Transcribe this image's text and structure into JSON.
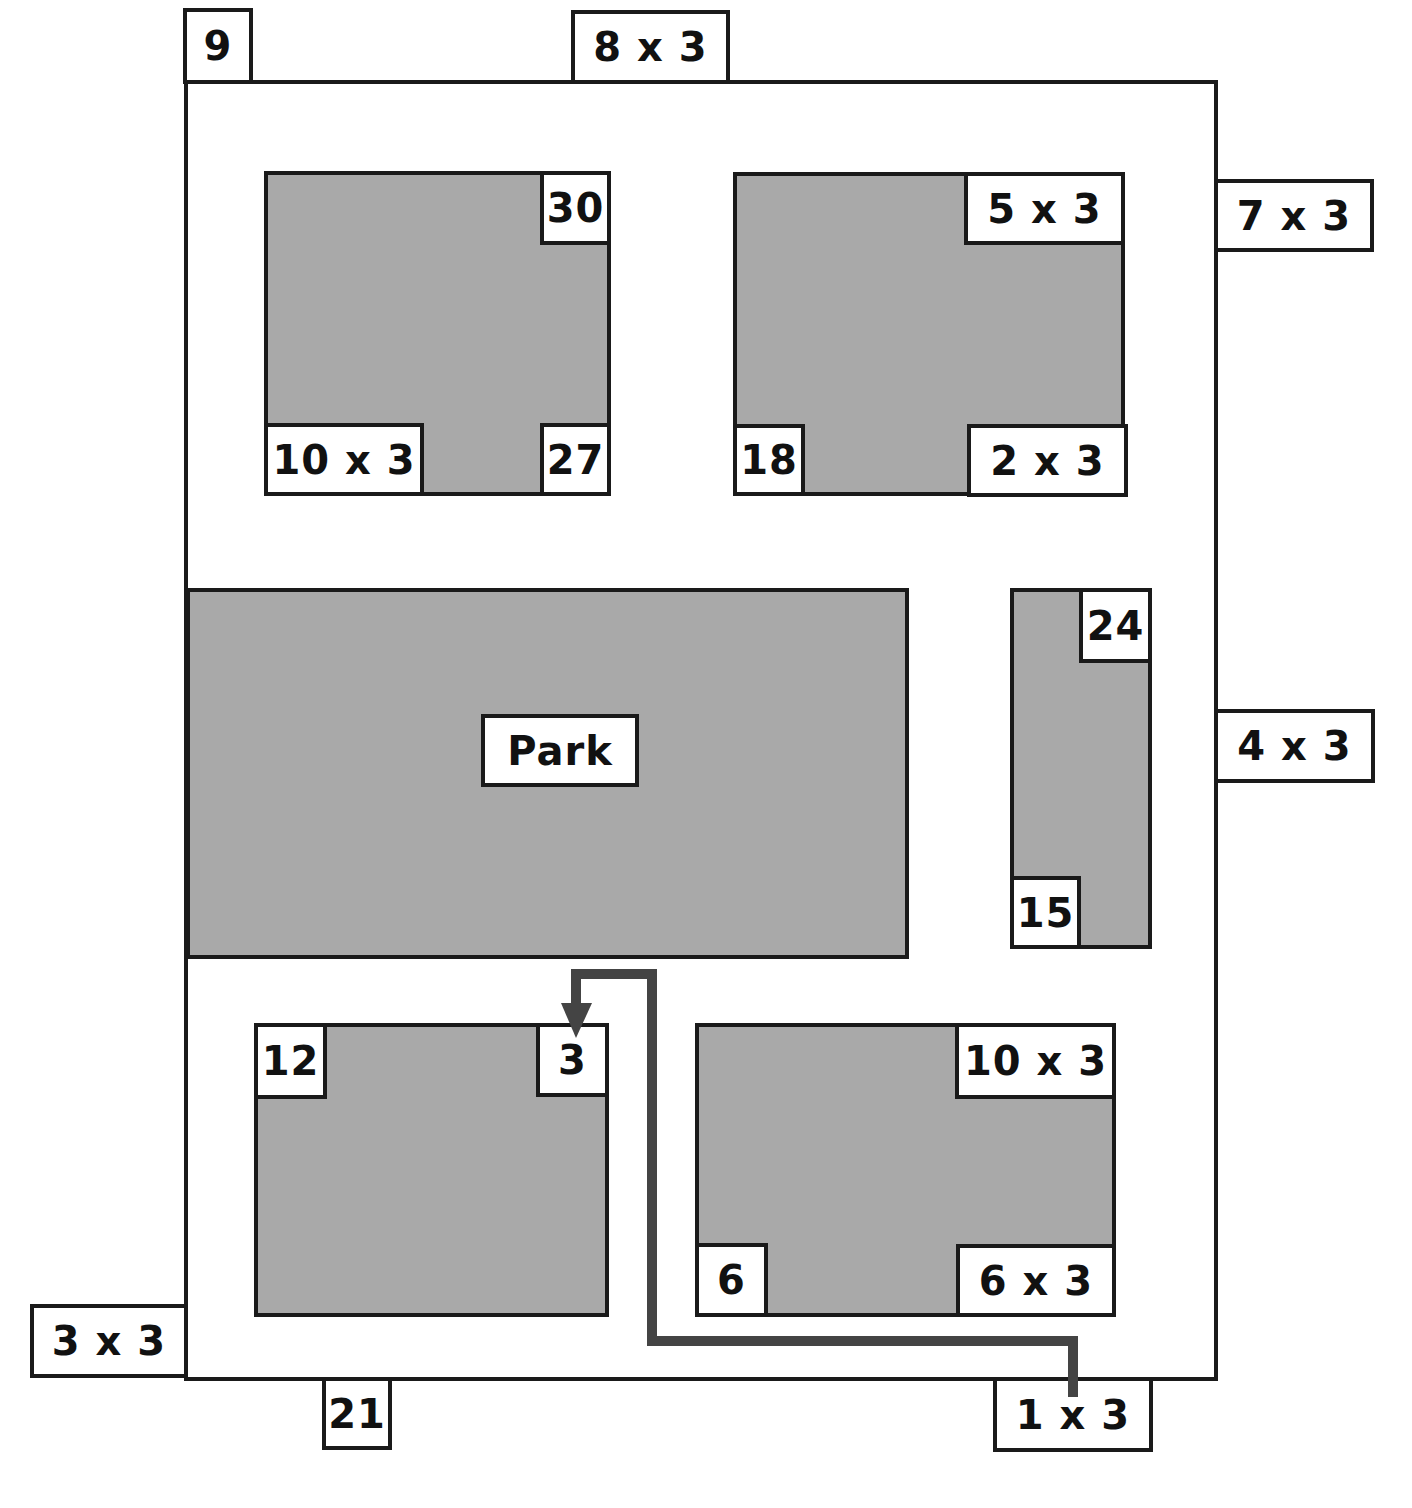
{
  "map": {
    "park_label": "Park",
    "route_color": "#444444",
    "block_fill": "#a9a9a9",
    "outer_labels": {
      "top_left": "9",
      "top": "8 x 3",
      "right_upper": "7 x 3",
      "right_middle": "4 x 3",
      "left_bottom": "3 x 3",
      "bottom_left": "21",
      "bottom_right": "1 x 3"
    },
    "blocks": [
      {
        "name": "top-left-block",
        "labels": {
          "top_right": "30",
          "bottom_left": "10 x 3",
          "bottom_right": "27"
        }
      },
      {
        "name": "top-right-block",
        "labels": {
          "top_right": "5 x 3",
          "bottom_left": "18",
          "bottom_right": "2 x 3"
        }
      },
      {
        "name": "tall-block",
        "labels": {
          "top_right": "24",
          "bottom_left": "15"
        }
      },
      {
        "name": "bottom-left-block",
        "labels": {
          "top_left": "12",
          "top_right": "3"
        }
      },
      {
        "name": "bottom-right-block",
        "labels": {
          "top_right": "10 x 3",
          "bottom_left": "6",
          "bottom_right": "6 x 3"
        }
      }
    ],
    "route": {
      "from": "1 x 3",
      "to": "3"
    }
  }
}
